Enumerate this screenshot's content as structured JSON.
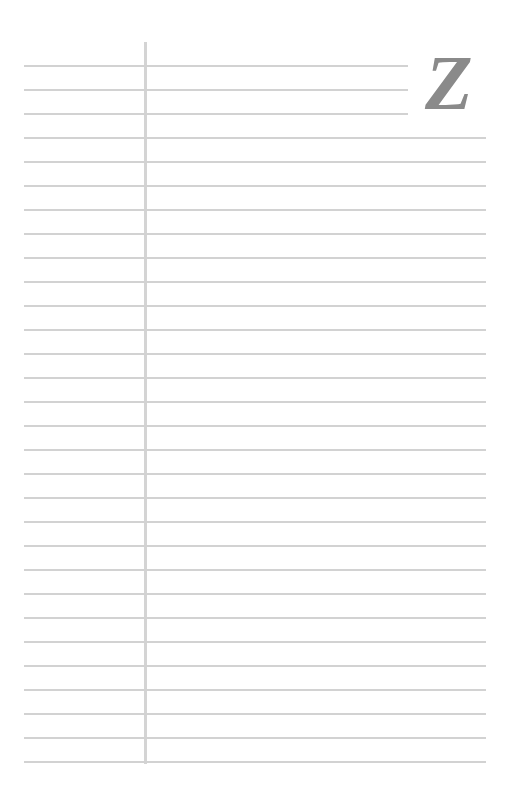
{
  "page": {
    "type": "lined-index-sheet",
    "index_letter": "Z",
    "line_count": 30,
    "line_color": "#d2d2d2",
    "margin_line_color": "#d4d4d4",
    "letter_color": "#8a8a8a"
  }
}
